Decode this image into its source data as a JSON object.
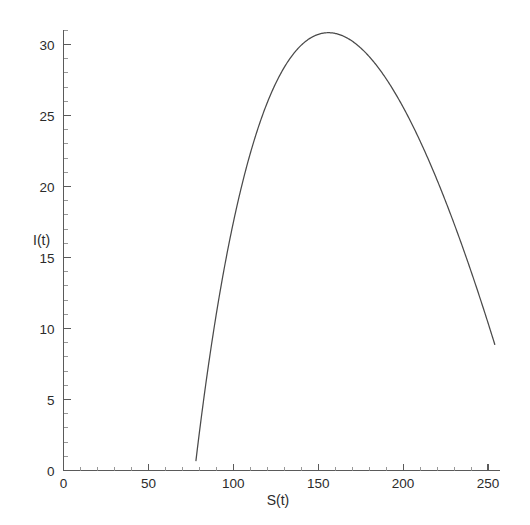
{
  "figure": {
    "background_color": "#ffffff",
    "ink_color": "#4a4a4a",
    "axis_color": "#5a5a5a"
  },
  "chart_data": {
    "type": "line",
    "title": "",
    "subtitle": "",
    "xlabel": "S(t)",
    "ylabel": "I(t)",
    "xlim": [
      0,
      257
    ],
    "ylim": [
      0,
      31
    ],
    "grid": false,
    "legend": null,
    "x_ticks": [
      0,
      50,
      100,
      150,
      200,
      250
    ],
    "x_tick_labels": [
      "0",
      "50",
      "100",
      "150",
      "200",
      "250"
    ],
    "x_minor_tick_step": 10,
    "y_ticks": [
      0,
      5,
      10,
      15,
      20,
      25,
      30
    ],
    "y_tick_labels": [
      "0",
      "5",
      "10",
      "15",
      "20",
      "25",
      "30"
    ],
    "y_minor_tick_step": 1,
    "annotations": [],
    "series": [
      {
        "name": "I vs S trajectory",
        "color": "#4a4a4a",
        "style": "solid",
        "x": [
          78,
          80,
          83,
          86,
          90,
          94,
          98,
          103,
          108,
          113,
          118,
          123,
          128,
          133,
          138,
          143,
          148,
          152,
          156,
          160,
          165,
          170,
          175,
          180,
          185,
          190,
          195,
          200,
          205,
          210,
          215,
          220,
          225,
          230,
          235,
          240,
          245,
          250,
          254
        ],
        "y": [
          0.7,
          1.8,
          3.4,
          4.9,
          6.8,
          8.6,
          10.3,
          12.3,
          14.2,
          15.9,
          17.6,
          19.1,
          20.6,
          21.9,
          23.2,
          24.3,
          25.4,
          26.1,
          26.7,
          27.1,
          27.5,
          27.8,
          27.9,
          27.8,
          27.6,
          27.3,
          26.9,
          26.4,
          25.7,
          25.0,
          24.2,
          23.3,
          22.3,
          21.2,
          20.0,
          18.7,
          17.3,
          15.8,
          14.7
        ]
      }
    ],
    "peak": {
      "x": 156,
      "y": 30.3,
      "label": ""
    },
    "endpoints": [
      {
        "x": 78,
        "y": 0.7
      },
      {
        "x": 254,
        "y": 7.0
      }
    ]
  },
  "axis_labels": {
    "x_title": "S(t)",
    "y_title": "I(t)"
  }
}
